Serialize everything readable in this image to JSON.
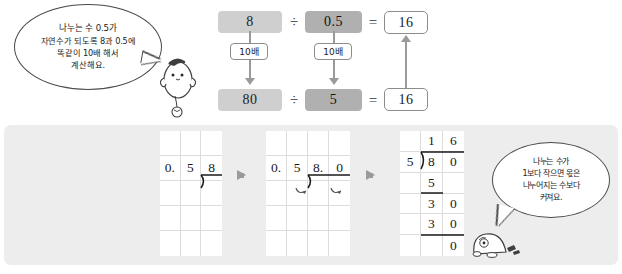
{
  "page": {
    "language": "ko",
    "topic": "decimal-division-by-shifting",
    "background": "#ffffff",
    "panel_background": "#ededed"
  },
  "colors": {
    "chip_light": "#cfcfcf",
    "chip_dark": "#b0b0b0",
    "arrow_gray": "#9a9a9a",
    "grid_line": "#dcdcdc",
    "ink": "#1a1a1a"
  },
  "bubbles": {
    "top": {
      "name": "hint-bubble-top",
      "lines": [
        "나누는 수 0.5가",
        "자연수가 되도록 8과 0.5에",
        "똑같이 10배 해서",
        "계산해요."
      ]
    },
    "bottom": {
      "name": "hint-bubble-bottom",
      "lines": [
        "나누는 수가",
        "1보다 작으면 몫은",
        "나누어지는 수보다",
        "커져요."
      ]
    }
  },
  "equation": {
    "row_top": {
      "dividend": "8",
      "operator": "÷",
      "divisor": "0.5",
      "equals": "=",
      "result": "16"
    },
    "row_bottom": {
      "dividend": "80",
      "operator": "÷",
      "divisor": "5",
      "equals": "=",
      "result": "16"
    },
    "transform_label_dividend": "10배",
    "transform_label_divisor": "10배"
  },
  "steps": {
    "arrow_glyph": "➡",
    "panel1": {
      "name": "long-division-step-1",
      "columns": 3,
      "rows": 5,
      "expression": "0.5)8",
      "cells": [
        [
          "",
          "",
          ""
        ],
        [
          "0.",
          "5",
          "8"
        ],
        [
          "",
          "",
          ""
        ],
        [
          "",
          "",
          ""
        ],
        [
          "",
          "",
          ""
        ]
      ]
    },
    "panel2": {
      "name": "long-division-step-2",
      "columns": 4,
      "rows": 5,
      "expression": "0.5)8.0",
      "cells": [
        [
          "",
          "",
          "",
          ""
        ],
        [
          "0.",
          "5",
          "8.",
          "0"
        ],
        [
          "",
          "",
          "",
          ""
        ],
        [
          "",
          "",
          "",
          ""
        ],
        [
          "",
          "",
          "",
          ""
        ]
      ]
    },
    "panel3": {
      "name": "long-division-step-3",
      "columns": 3,
      "rows": 6,
      "expression": "5)80 = 16",
      "quotient": "16",
      "cells": [
        [
          "",
          "1",
          "6"
        ],
        [
          "5",
          "8",
          "0"
        ],
        [
          "",
          "5",
          ""
        ],
        [
          "",
          "3",
          "0"
        ],
        [
          "",
          "3",
          "0"
        ],
        [
          "",
          "",
          "0"
        ]
      ]
    }
  }
}
